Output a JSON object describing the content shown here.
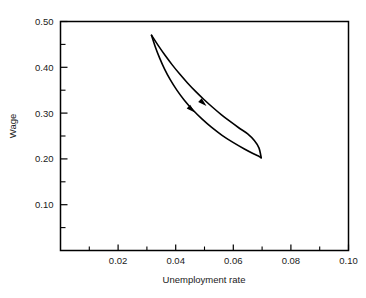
{
  "chart_data": {
    "type": "line",
    "title": "",
    "subtitle": "",
    "xlabel": "Unemployment rate",
    "ylabel": "Wage",
    "xlim": [
      0.0,
      0.1
    ],
    "ylim": [
      0.0,
      0.5
    ],
    "grid": false,
    "legend": null,
    "legend_position": "none",
    "xticks": [
      0.02,
      0.04,
      0.06,
      0.08,
      0.1
    ],
    "xticklabels": [
      "0.02",
      "0.04",
      "0.06",
      "0.08",
      "0.10"
    ],
    "xminorticks": [
      0.01,
      0.03,
      0.05,
      0.07,
      0.09
    ],
    "yticks": [
      0.1,
      0.2,
      0.3,
      0.4,
      0.5
    ],
    "yticklabels": [
      "0.10",
      "0.20",
      "0.30",
      "0.40",
      "0.50"
    ],
    "yminorticks": [
      0.05,
      0.15,
      0.25,
      0.35,
      0.45
    ],
    "line_color": "#000000",
    "line_width": 1.6,
    "annotations": [
      {
        "name": "arrow-upper-branch",
        "x": 0.0496,
        "y": 0.3215,
        "direction": "down-right"
      },
      {
        "name": "arrow-lower-branch",
        "x": 0.0456,
        "y": 0.3075,
        "direction": "down-right"
      }
    ],
    "series": [
      {
        "name": "upper-branch",
        "points": [
          [
            0.0316,
            0.47
          ],
          [
            0.0339,
            0.4478
          ],
          [
            0.0363,
            0.4262
          ],
          [
            0.0388,
            0.4053
          ],
          [
            0.0414,
            0.3852
          ],
          [
            0.0441,
            0.3659
          ],
          [
            0.0469,
            0.3474
          ],
          [
            0.0498,
            0.3297
          ],
          [
            0.0528,
            0.3128
          ],
          [
            0.0558,
            0.2968
          ],
          [
            0.0589,
            0.2817
          ],
          [
            0.062,
            0.2675
          ],
          [
            0.065,
            0.2545
          ],
          [
            0.0673,
            0.24
          ],
          [
            0.0689,
            0.224
          ],
          [
            0.0697,
            0.2025
          ]
        ]
      },
      {
        "name": "lower-branch",
        "points": [
          [
            0.0316,
            0.47
          ],
          [
            0.0329,
            0.445
          ],
          [
            0.0344,
            0.4205
          ],
          [
            0.0361,
            0.3965
          ],
          [
            0.0381,
            0.373
          ],
          [
            0.0404,
            0.3502
          ],
          [
            0.043,
            0.3282
          ],
          [
            0.0459,
            0.3072
          ],
          [
            0.0491,
            0.2873
          ],
          [
            0.0525,
            0.2687
          ],
          [
            0.0561,
            0.2515
          ],
          [
            0.0599,
            0.236
          ],
          [
            0.0637,
            0.2222
          ],
          [
            0.067,
            0.2112
          ],
          [
            0.069,
            0.2052
          ],
          [
            0.0697,
            0.2025
          ]
        ]
      }
    ]
  },
  "axes": {
    "x_title": "Unemployment rate",
    "y_title": "Wage"
  }
}
